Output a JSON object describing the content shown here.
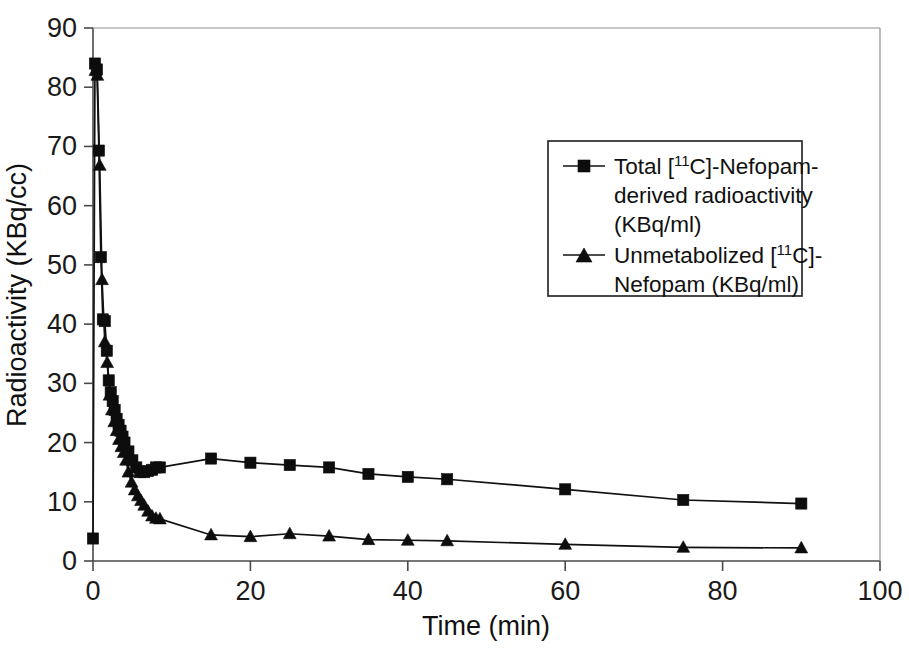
{
  "chart_data": {
    "type": "line",
    "title": "",
    "xlabel": "Time (min)",
    "ylabel": "Radioactivity (KBq/cc)",
    "xlim": [
      0,
      100
    ],
    "ylim": [
      0,
      90
    ],
    "xticks": [
      0,
      20,
      40,
      60,
      80,
      100
    ],
    "yticks": [
      0,
      10,
      20,
      30,
      40,
      50,
      60,
      70,
      80,
      90
    ],
    "xtick_labels": [
      "0",
      "20",
      "40",
      "60",
      "80",
      "100"
    ],
    "ytick_labels": [
      "0",
      "10",
      "20",
      "30",
      "40",
      "50",
      "60",
      "70",
      "80",
      "90"
    ],
    "grid": false,
    "legend_position": "upper-right-inside",
    "series": [
      {
        "name": "Total [11C]-Nefopam-derived radioactivity (KBq/ml)",
        "marker": "square",
        "color": "#0d0d0d",
        "x": [
          0.0,
          0.25,
          0.5,
          0.75,
          1.0,
          1.25,
          1.5,
          1.75,
          2.0,
          2.25,
          2.5,
          2.75,
          3.0,
          3.25,
          3.5,
          3.75,
          4.0,
          4.5,
          5.0,
          5.5,
          6.0,
          6.5,
          7.0,
          7.5,
          8.0,
          8.5,
          15.0,
          20.0,
          25.0,
          30.0,
          35.0,
          40.0,
          45.0,
          60.0,
          75.0,
          90.0
        ],
        "y": [
          3.8,
          84.0,
          83.0,
          69.3,
          51.3,
          40.8,
          40.5,
          35.5,
          30.5,
          28.5,
          27.0,
          25.5,
          24.0,
          23.0,
          22.0,
          21.0,
          20.0,
          18.5,
          17.0,
          15.8,
          15.0,
          15.0,
          15.2,
          15.4,
          15.8,
          15.8,
          17.3,
          16.6,
          16.2,
          15.8,
          14.7,
          14.2,
          13.8,
          12.1,
          10.3,
          9.7
        ]
      },
      {
        "name": "Unmetabolized [11C]-Nefopam (KBq/ml)",
        "marker": "triangle",
        "color": "#0d0d0d",
        "x": [
          0.3,
          0.55,
          0.85,
          1.15,
          1.5,
          1.8,
          2.1,
          2.4,
          2.7,
          3.0,
          3.3,
          3.6,
          3.9,
          4.2,
          4.5,
          4.9,
          5.3,
          5.7,
          6.1,
          6.5,
          7.0,
          7.5,
          8.0,
          8.5,
          15.0,
          20.0,
          25.0,
          30.0,
          35.0,
          40.0,
          45.0,
          60.0,
          75.0,
          90.0
        ],
        "y": [
          82.8,
          82.0,
          66.8,
          47.5,
          37.0,
          33.5,
          28.0,
          25.5,
          23.5,
          22.0,
          20.5,
          19.3,
          18.3,
          17.0,
          15.0,
          13.3,
          12.0,
          11.0,
          10.2,
          9.4,
          8.4,
          7.6,
          7.2,
          7.1,
          4.4,
          4.1,
          4.6,
          4.2,
          3.6,
          3.5,
          3.4,
          2.8,
          2.3,
          2.2
        ]
      }
    ]
  },
  "legend": {
    "entries": [
      {
        "marker": "square",
        "parts": [
          "Total [",
          "11",
          "C]-Nefopam-"
        ],
        "line2": "derived radioactivity",
        "line3": "(KBq/ml)"
      },
      {
        "marker": "triangle",
        "parts": [
          "Unmetabolized [",
          "11",
          "C]-"
        ],
        "line2": "Nefopam (KBq/ml)",
        "line3": ""
      }
    ]
  },
  "axes": {
    "x_title": "Time (min)",
    "y_title": "Radioactivity (KBq/cc)"
  }
}
